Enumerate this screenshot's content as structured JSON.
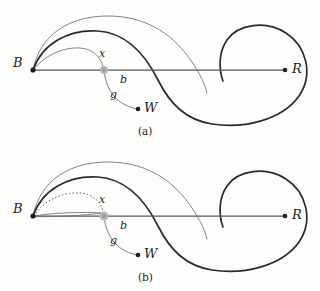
{
  "figure": {
    "background_color": "#fdfdfc",
    "colors": {
      "thick_curve": "#2b2b2b",
      "thin_curve": "#6f6f72",
      "axis_line": "#555558",
      "dotted_curve": "#4a4a4c",
      "point_black": "#1d1d1d",
      "point_gray": "#b9b9bb"
    }
  },
  "panels": [
    {
      "id": "a",
      "caption": "(a)",
      "points": [
        {
          "name": "B",
          "label": "B",
          "marker": "black-dot",
          "x": 32,
          "y": 70
        },
        {
          "name": "x",
          "label": "x",
          "marker": "gray-dot",
          "x": 104,
          "y": 70
        },
        {
          "name": "W",
          "label": "W",
          "marker": "black-dot",
          "x": 138,
          "y": 109
        },
        {
          "name": "R",
          "label": "R",
          "marker": "black-dot",
          "x": 285,
          "y": 70
        }
      ],
      "curve_labels": [
        {
          "name": "b",
          "label": "b",
          "x": 122,
          "y": 79
        },
        {
          "name": "g",
          "label": "g",
          "x": 113,
          "y": 94
        }
      ],
      "curves": [
        {
          "name": "outer-thin-arc",
          "style": "thin"
        },
        {
          "name": "main-thick-spiral",
          "style": "thick"
        },
        {
          "name": "lower-thin-arc-through-x",
          "style": "thin"
        },
        {
          "name": "axis-B-to-R",
          "style": "axis"
        },
        {
          "name": "g-curve-x-to-W",
          "style": "thin"
        }
      ]
    },
    {
      "id": "b",
      "caption": "(b)",
      "points": [
        {
          "name": "B",
          "label": "B",
          "marker": "black-dot",
          "x": 32,
          "y": 70
        },
        {
          "name": "x",
          "label": "x",
          "marker": "gray-dot",
          "x": 104,
          "y": 70
        },
        {
          "name": "W",
          "label": "W",
          "marker": "black-dot",
          "x": 138,
          "y": 109
        },
        {
          "name": "R",
          "label": "R",
          "marker": "black-dot",
          "x": 285,
          "y": 70
        }
      ],
      "curve_labels": [
        {
          "name": "b",
          "label": "b",
          "x": 122,
          "y": 79
        },
        {
          "name": "g",
          "label": "g",
          "x": 113,
          "y": 94
        }
      ],
      "curves": [
        {
          "name": "outer-thin-arc",
          "style": "thin"
        },
        {
          "name": "main-thick-spiral",
          "style": "thick"
        },
        {
          "name": "dotted-arc-B-to-x",
          "style": "dotted"
        },
        {
          "name": "axis-B-to-R",
          "style": "axis"
        },
        {
          "name": "pinched-loop-B-to-x",
          "style": "thin"
        },
        {
          "name": "g-curve-x-to-W",
          "style": "thin"
        }
      ]
    }
  ]
}
